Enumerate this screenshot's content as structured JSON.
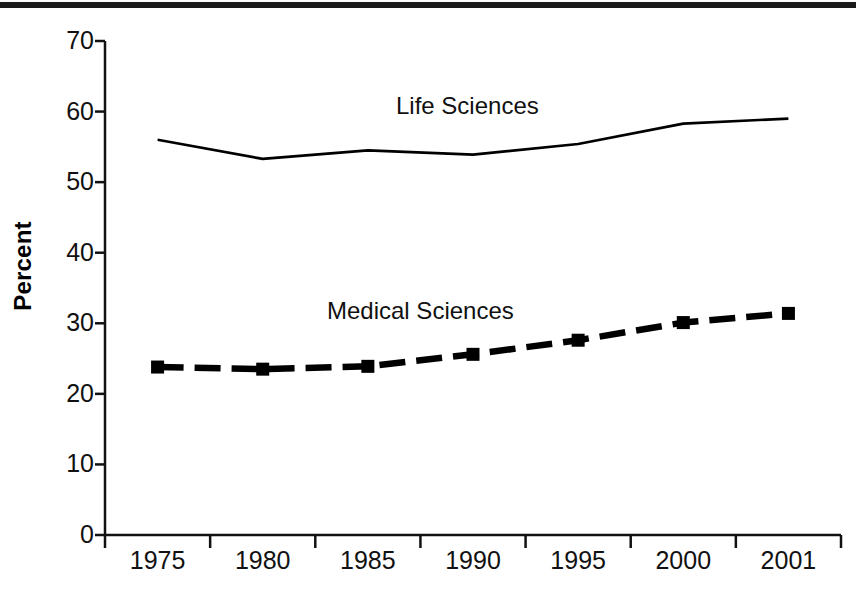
{
  "chart_data": {
    "type": "line",
    "title": "",
    "xlabel": "",
    "ylabel": "Percent",
    "x": [
      "1975",
      "1980",
      "1985",
      "1990",
      "1995",
      "2000",
      "2001"
    ],
    "categories": [
      "1975",
      "1980",
      "1985",
      "1990",
      "1995",
      "2000",
      "2001"
    ],
    "ylim": [
      0,
      70
    ],
    "yticks": [
      0,
      10,
      20,
      30,
      40,
      50,
      60,
      70
    ],
    "ytick_labels": [
      "0",
      "10",
      "20",
      "30",
      "40",
      "50",
      "60",
      "70"
    ],
    "grid": false,
    "legend_position": "inline-annotations",
    "series": [
      {
        "name": "Life Sciences",
        "values": [
          56.0,
          53.3,
          54.5,
          53.9,
          55.4,
          58.3,
          59.0
        ],
        "style": "solid",
        "color": "#000000",
        "markers": false
      },
      {
        "name": "Medical Sciences",
        "values": [
          23.8,
          23.5,
          23.9,
          25.6,
          27.6,
          30.1,
          31.4
        ],
        "style": "dashed",
        "color": "#000000",
        "markers": true
      }
    ],
    "annotations": [
      {
        "text": "Life Sciences",
        "series": "Life Sciences"
      },
      {
        "text": "Medical Sciences",
        "series": "Medical Sciences"
      }
    ]
  },
  "axis": {
    "y_title": "Percent",
    "y_tick_labels": [
      "70",
      "60",
      "50",
      "40",
      "30",
      "20",
      "10",
      "0"
    ],
    "x_tick_labels": [
      "1975",
      "1980",
      "1985",
      "1990",
      "1995",
      "2000",
      "2001"
    ]
  },
  "labels": {
    "life_sciences": "Life Sciences",
    "medical_sciences": "Medical Sciences"
  },
  "colors": {
    "ink": "#000000",
    "rule": "#1a1a1a",
    "background": "#ffffff"
  }
}
